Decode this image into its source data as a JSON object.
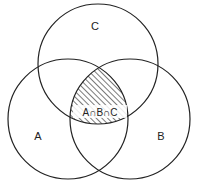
{
  "diagram": {
    "type": "venn",
    "sets": [
      {
        "id": "A",
        "label": "A",
        "cx": 68,
        "cy": 119,
        "r": 60
      },
      {
        "id": "B",
        "label": "B",
        "cx": 130,
        "cy": 119,
        "r": 60
      },
      {
        "id": "C",
        "label": "C",
        "cx": 98,
        "cy": 64,
        "r": 60
      }
    ],
    "shaded_region": {
      "description": "intersection of A, B and C",
      "label": "A∩B∩C",
      "fill": "hatched"
    },
    "colors": {
      "stroke": "#222222",
      "background": "#ffffff",
      "hatch": "#333333"
    }
  }
}
